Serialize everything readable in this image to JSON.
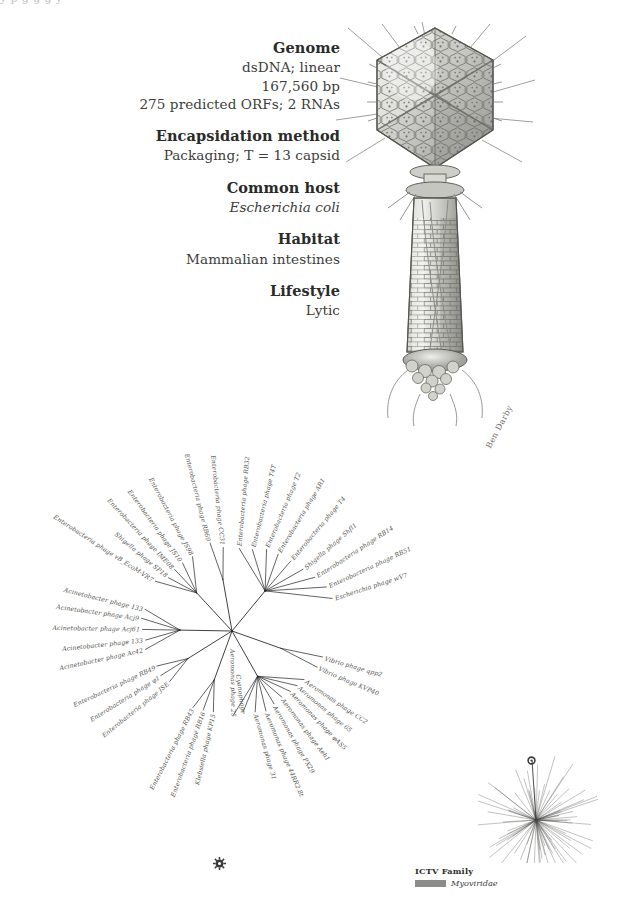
{
  "top_artifact": "y  p  g            g                   g        y",
  "facts": [
    {
      "heading": "Genome",
      "lines": [
        "dsDNA; linear",
        "167,560 bp",
        "275 predicted ORFs; 2 RNAs"
      ],
      "italic": [
        false,
        false,
        false
      ]
    },
    {
      "heading": "Encapsidation method",
      "lines": [
        "Packaging; T = 13 capsid"
      ],
      "italic": [
        false
      ]
    },
    {
      "heading": "Common host",
      "lines": [
        "Escherichia coli"
      ],
      "italic": [
        true
      ]
    },
    {
      "heading": "Habitat",
      "lines": [
        "Mammalian intestines"
      ],
      "italic": [
        false
      ]
    },
    {
      "heading": "Lifestyle",
      "lines": [
        "Lytic"
      ],
      "italic": [
        false
      ]
    }
  ],
  "illustration": {
    "subject": "bacteriophage-T4-myovirus",
    "signature": "Ben Darby"
  },
  "legend": {
    "title": "ICTV Family",
    "family": "Myoviridae",
    "swatch_color": "#8c8c8a"
  },
  "tree": {
    "type": "unrooted-radial-phylogram",
    "focal_node_icon": "sun-burst-node-marker",
    "tips": [
      {
        "label": "Enterobacteria phage RB69",
        "angle": 104,
        "radius": 162,
        "anchor": "end"
      },
      {
        "label": "Enterobacteria phage CC31",
        "angle": 96,
        "radius": 150,
        "anchor": "end"
      },
      {
        "label": "Enterobacteria phage RB32",
        "angle": 85,
        "radius": 148,
        "anchor": "start"
      },
      {
        "label": "Enterobacteria phage T4T",
        "angle": 76,
        "radius": 150,
        "anchor": "start"
      },
      {
        "label": "Enterobacteria phage T2",
        "angle": 67,
        "radius": 158,
        "anchor": "start"
      },
      {
        "label": "Enterobacteria phage AR1",
        "angle": 59,
        "radius": 160,
        "anchor": "start"
      },
      {
        "label": "Enterobacteria phage T4",
        "angle": 50,
        "radius": 163,
        "anchor": "start"
      },
      {
        "label": "Shigella phage Shfl1",
        "angle": 41,
        "radius": 168,
        "anchor": "start"
      },
      {
        "label": "Enterobacteria phage RB14",
        "angle": 33,
        "radius": 176,
        "anchor": "start"
      },
      {
        "label": "Enterobacteria phage RB51",
        "angle": 25,
        "radius": 186,
        "anchor": "start"
      },
      {
        "label": "Escherichia phage wV7",
        "angle": 18,
        "radius": 188,
        "anchor": "start"
      },
      {
        "label": "Enterobacteria phage JS98",
        "angle": 118,
        "radius": 150,
        "anchor": "end"
      },
      {
        "label": "Enterobacteria phage JS10",
        "angle": 126,
        "radius": 150,
        "anchor": "end"
      },
      {
        "label": "Enterobacteria phage IME08",
        "angle": 133,
        "radius": 150,
        "anchor": "end"
      },
      {
        "label": "Shigella phage SP18",
        "angle": 140,
        "radius": 148,
        "anchor": "end"
      },
      {
        "label": "Enterobacteria phage vB_EcoM-VR7",
        "angle": 147,
        "radius": 163,
        "anchor": "end"
      },
      {
        "label": "Acinetobacter phage 133",
        "angle": 166,
        "radius": 160,
        "anchor": "end"
      },
      {
        "label": "Acinetobacter phage Acj9",
        "angle": 172,
        "radius": 163,
        "anchor": "end"
      },
      {
        "label": "Acinetobacter phage Acj61",
        "angle": 179,
        "radius": 160,
        "anchor": "end"
      },
      {
        "label": "Acinetobacter phage 133",
        "angle": 186,
        "radius": 155,
        "anchor": "end"
      },
      {
        "label": "Acinetobacter phage Ac42",
        "angle": 192,
        "radius": 158,
        "anchor": "end"
      },
      {
        "label": "Enterobacteria phage RB49",
        "angle": 205,
        "radius": 148,
        "anchor": "end"
      },
      {
        "label": "Enterobacteria phage φ1",
        "angle": 212,
        "radius": 150,
        "anchor": "end"
      },
      {
        "label": "Enterobacteria phage JSE",
        "angle": 219,
        "radius": 143,
        "anchor": "end"
      },
      {
        "label": "Enterobacteria phage RB43",
        "angle": 243,
        "radius": 153,
        "anchor": "end"
      },
      {
        "label": "Enterobacteria phage RB16",
        "angle": 250,
        "radius": 150,
        "anchor": "end"
      },
      {
        "label": "Klebsiella phage KP15",
        "angle": 257,
        "radius": 148,
        "anchor": "end"
      },
      {
        "label": "Aeromonas phage 25",
        "angle": 271,
        "radius": 150,
        "anchor": "end"
      },
      {
        "label": "Cyanophage",
        "angle": 278,
        "radius": 145,
        "anchor": "end"
      },
      {
        "label": "Aeromonas phage 31",
        "angle": 286,
        "radius": 150,
        "anchor": "start"
      },
      {
        "label": "Aeromonas phage 44RR2.8t",
        "angle": 293,
        "radius": 155,
        "anchor": "start"
      },
      {
        "label": "Aeromonas phage PX29",
        "angle": 300,
        "radius": 150,
        "anchor": "start"
      },
      {
        "label": "Aeromonas phage Aeh1",
        "angle": 307,
        "radius": 148,
        "anchor": "start"
      },
      {
        "label": "Aeromonas phage φAS5",
        "angle": 314,
        "radius": 150,
        "anchor": "start"
      },
      {
        "label": "Aeromonas phage 65",
        "angle": 320,
        "radius": 152,
        "anchor": "start"
      },
      {
        "label": "Aeromonas phage CC2",
        "angle": 326,
        "radius": 155,
        "anchor": "start"
      },
      {
        "label": "Vibrio phage KVP40",
        "angle": 337,
        "radius": 165,
        "anchor": "start"
      },
      {
        "label": "Vibrio phage qpp2",
        "angle": 344,
        "radius": 168,
        "anchor": "start"
      }
    ]
  }
}
